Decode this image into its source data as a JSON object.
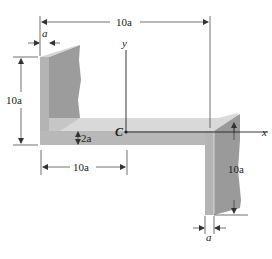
{
  "figure": {
    "colors": {
      "front_face": "#a9a9a9",
      "side_face": "#8f8f8f",
      "top_face": "#d9d9d9",
      "lines": "#333333",
      "background": "#ffffff"
    }
  },
  "labels": {
    "top_width": "10a",
    "top_left_thickness": "a",
    "left_height": "10a",
    "web_thickness": "2a",
    "centroid": "C",
    "y_axis": "y",
    "x_axis": "x",
    "bottom_left_width": "10a",
    "right_height": "10a",
    "bottom_right_thickness": "a"
  }
}
